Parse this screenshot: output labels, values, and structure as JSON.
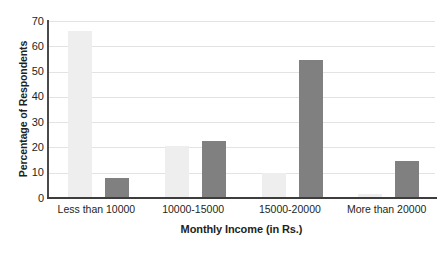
{
  "chart_data": {
    "type": "bar",
    "title": "",
    "subtitle": "",
    "xlabel": "Monthly Income (in Rs.)",
    "ylabel": "Percentage of Respondents",
    "categories": [
      "Less than 10000",
      "10000-15000",
      "15000-20000",
      "More than 20000"
    ],
    "series": [
      {
        "name": "series-1",
        "color": "#eeeeee",
        "values": [
          66,
          20.5,
          9.8,
          1.5
        ]
      },
      {
        "name": "series-2",
        "color": "#808080",
        "values": [
          7.8,
          22.5,
          54.5,
          14.5
        ]
      }
    ],
    "ylim": [
      0,
      70
    ],
    "ytick_values": [
      0,
      10,
      20,
      30,
      40,
      50,
      60,
      70
    ],
    "ytick_labels": [
      "0",
      "10",
      "20",
      "30",
      "40",
      "50",
      "60",
      "70"
    ],
    "grid": true,
    "grid_axis": "y",
    "legend": false,
    "legend_position": "none",
    "axis_line_color": "#3d3d3d",
    "gridline_color": "#e3e3e3",
    "background_color": "#ffffff"
  }
}
